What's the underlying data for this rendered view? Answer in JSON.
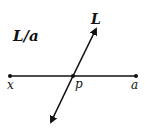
{
  "diagram": {
    "title_label": "L/a",
    "line_label": "L",
    "points": {
      "x": "x",
      "p": "p",
      "a": "a"
    },
    "colors": {
      "stroke": "#111111",
      "background": "#ffffff"
    }
  }
}
